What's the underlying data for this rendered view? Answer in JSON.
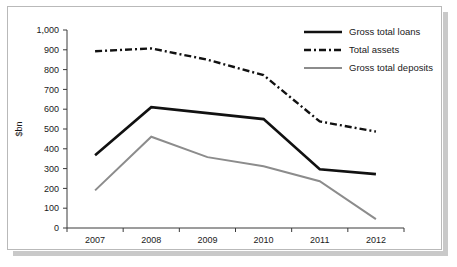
{
  "chart_data": {
    "type": "line",
    "title": "",
    "subtitle": "",
    "xlabel": "",
    "ylabel": "$bn",
    "categories": [
      "2007",
      "2008",
      "2009",
      "2010",
      "2011",
      "2012"
    ],
    "x": [
      2007,
      2008,
      2009,
      2010,
      2011,
      2012
    ],
    "ylim": [
      0,
      1000
    ],
    "yticks": [
      0,
      100,
      200,
      300,
      400,
      500,
      600,
      700,
      800,
      900,
      1000
    ],
    "ytick_labels": [
      "0",
      "100",
      "200",
      "300",
      "400",
      "500",
      "600",
      "700",
      "800",
      "900",
      "1,000"
    ],
    "grid": false,
    "legend_position": "top-right",
    "series": [
      {
        "name": "Gross total loans",
        "values": [
          368,
          610,
          580,
          550,
          297,
          272
        ],
        "color": "#111111",
        "style": "solid",
        "width": 2.6
      },
      {
        "name": "Total assets",
        "values": [
          893,
          907,
          850,
          772,
          538,
          487
        ],
        "color": "#111111",
        "style": "dash-dot",
        "width": 2.4
      },
      {
        "name": "Gross total deposits",
        "values": [
          190,
          461,
          358,
          312,
          236,
          45
        ],
        "color": "#8c8c8c",
        "style": "solid",
        "width": 2.0
      }
    ]
  },
  "legend": {
    "entries": [
      {
        "label": "Gross total loans"
      },
      {
        "label": "Total assets"
      },
      {
        "label": "Gross total deposits"
      }
    ]
  },
  "axes": {
    "y_title": "$bn"
  }
}
